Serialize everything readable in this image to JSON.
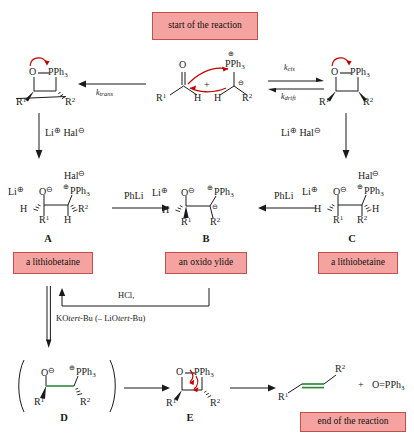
{
  "diagram": {
    "title_boxes": {
      "start": "start of the reaction",
      "end": "end of the reaction"
    },
    "labels": {
      "lithiobetaine_left": "a lithiobetaine",
      "oxido_ylide": "an oxido ylide",
      "lithiobetaine_right": "a lithiobetaine"
    },
    "structure_letters": {
      "a": "A",
      "b": "B",
      "c": "C",
      "d": "D",
      "e": "E"
    },
    "rate_constants": {
      "k_trans": "k",
      "k_trans_sub": "trans",
      "k_cis": "k",
      "k_cis_sub": "cis",
      "k_drift": "k",
      "k_drift_sub": "drift"
    },
    "reagents": {
      "li_hal_left": "Li",
      "li_hal_left_charge": "⊕",
      "li_hal_left_b": " Hal",
      "li_hal_left_charge_b": "⊖",
      "li_hal_right": "Li",
      "li_hal_right_charge": "⊕",
      "li_hal_right_b": " Hal",
      "li_hal_right_charge_b": "⊖",
      "phli_left": "PhLi",
      "phli_right": "PhLi",
      "hcl": "HCl,",
      "kotbu_pre": "KO",
      "kotbu_italic": "tert",
      "kotbu_post": "-Bu (– LiO",
      "kotbu_italic2": "tert",
      "kotbu_post2": "-Bu)"
    },
    "atoms": {
      "O": "O",
      "P": "PPh",
      "P_sub": "3",
      "H": "H",
      "R1": "R",
      "R1_sup": "1",
      "R2": "R",
      "R2_sup": "2",
      "Li": "Li",
      "Hal": "Hal",
      "plus": "⊕",
      "minus": "⊖",
      "plus_sign": "+",
      "opph3": "O=PPh",
      "opph3_sub": "3",
      "plus_plain": "+"
    },
    "colors": {
      "pink_fill": "#f4a3a0",
      "pink_border": "#c0504d",
      "arrow_red": "#c00000",
      "bond_green": "#2e8b3d",
      "ink": "#1a1a1a"
    }
  }
}
